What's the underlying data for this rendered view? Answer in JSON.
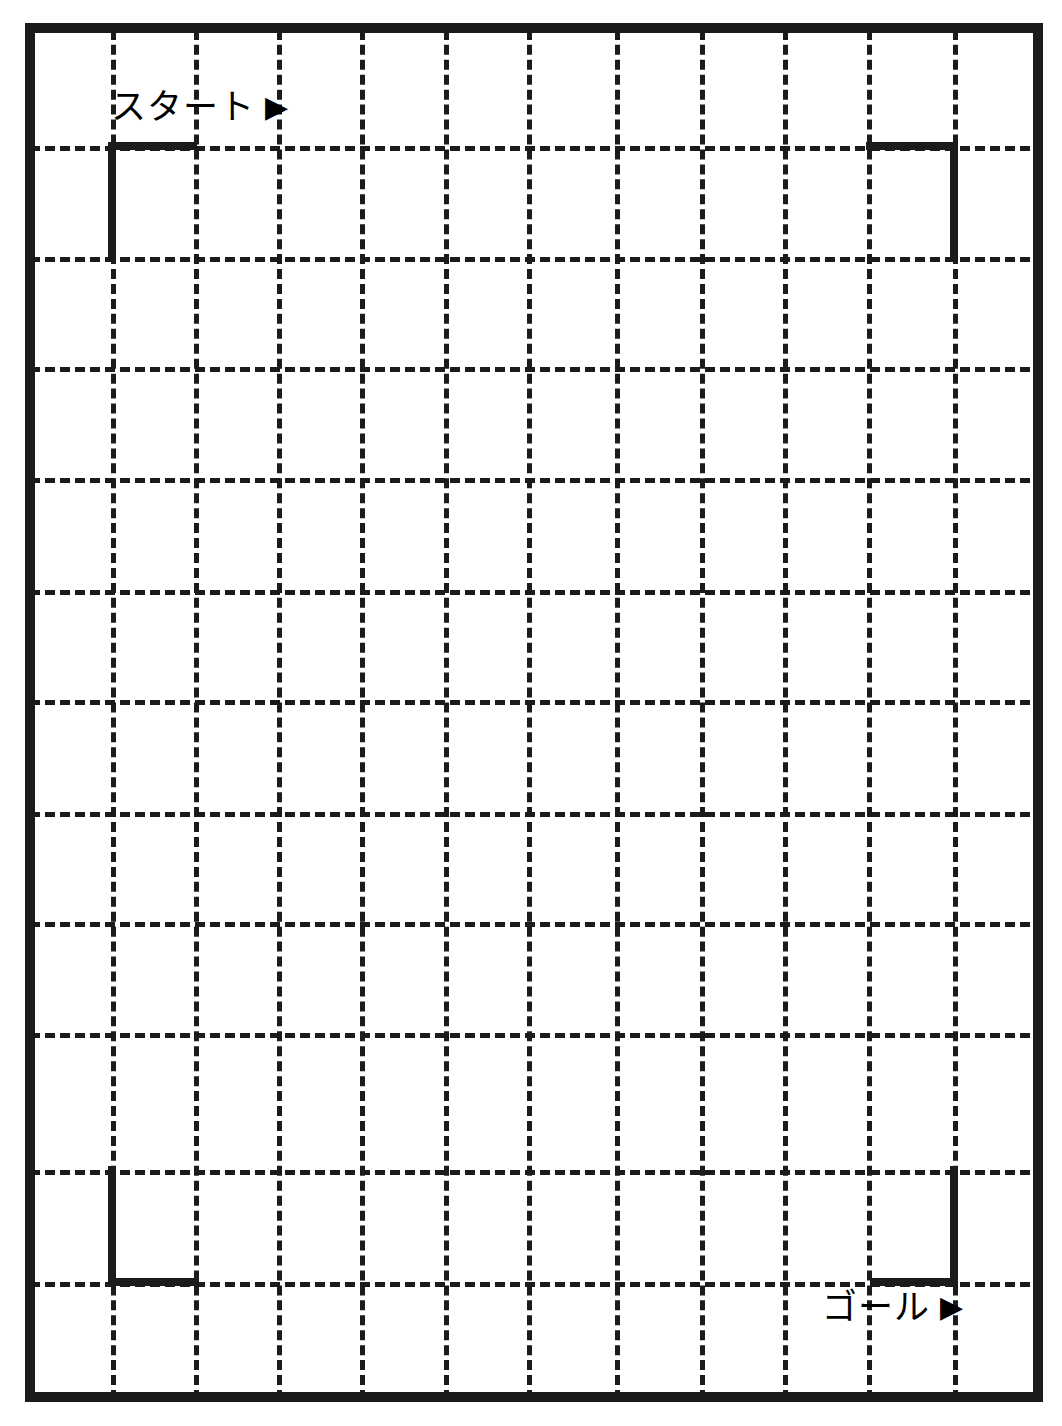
{
  "page": {
    "width": 1062,
    "height": 1426,
    "background_color": "#ffffff",
    "ink_color": "#1b1b1b"
  },
  "frame": {
    "name": "maze-outer-frame",
    "left": 25,
    "top": 23,
    "width": 1018,
    "height": 1379,
    "border_width": 10,
    "border_color": "#1b1b1b"
  },
  "grid": {
    "style": "dashed",
    "dash_color": "#1b1b1b",
    "dash_width": 5,
    "cell_size": 83,
    "columns": 11,
    "rows": 16,
    "vertical_line_x": [
      111,
      194,
      277,
      360,
      444,
      527,
      615,
      700,
      783,
      867,
      953
    ],
    "horizontal_line_y": [
      146,
      257,
      367,
      478,
      590,
      700,
      812,
      922,
      1033,
      1170,
      1282
    ]
  },
  "brackets": [
    {
      "name": "start-bracket",
      "corner": "top-left",
      "segments": [
        {
          "kind": "horizontal",
          "x": 108,
          "y": 142,
          "length": 89,
          "thickness": 8
        },
        {
          "kind": "vertical",
          "x": 108,
          "y": 142,
          "length": 119,
          "thickness": 8
        }
      ]
    },
    {
      "name": "top-right-bracket",
      "corner": "top-right",
      "segments": [
        {
          "kind": "horizontal",
          "x": 866,
          "y": 142,
          "length": 92,
          "thickness": 8
        },
        {
          "kind": "vertical",
          "x": 950,
          "y": 142,
          "length": 119,
          "thickness": 8
        }
      ]
    },
    {
      "name": "bottom-left-bracket",
      "corner": "bottom-left",
      "segments": [
        {
          "kind": "vertical",
          "x": 108,
          "y": 1166,
          "length": 120,
          "thickness": 8
        },
        {
          "kind": "horizontal",
          "x": 108,
          "y": 1278,
          "length": 91,
          "thickness": 8
        }
      ]
    },
    {
      "name": "goal-bracket",
      "corner": "bottom-right",
      "segments": [
        {
          "kind": "vertical",
          "x": 950,
          "y": 1166,
          "length": 120,
          "thickness": 8
        },
        {
          "kind": "horizontal",
          "x": 870,
          "y": 1278,
          "length": 88,
          "thickness": 8
        }
      ]
    }
  ],
  "labels": {
    "start": {
      "text": "スタート",
      "arrow": "▶",
      "meaning": "start",
      "x": 111,
      "y": 90
    },
    "goal": {
      "text": "ゴール",
      "arrow": "▶",
      "meaning": "goal",
      "x": 822,
      "y": 1290
    }
  }
}
